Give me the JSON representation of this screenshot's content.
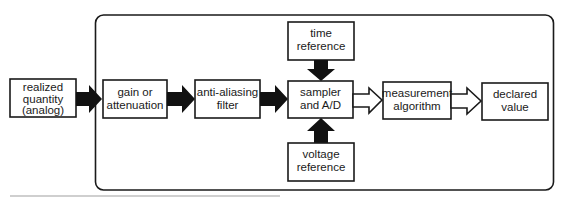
{
  "diagram": {
    "type": "block-diagram",
    "colors": {
      "stroke": "#1a1a1a",
      "background": "#ffffff",
      "rule": "#9a9a9a"
    },
    "input": {
      "lines": [
        "realized",
        "quantity",
        "(analog)"
      ]
    },
    "blocks": {
      "gain": {
        "lines": [
          "gain or",
          "attenuation"
        ]
      },
      "filter": {
        "lines": [
          "anti-aliasing",
          "filter"
        ]
      },
      "sampler": {
        "lines": [
          "sampler",
          "and A/D"
        ]
      },
      "time_ref": {
        "lines": [
          "time",
          "reference"
        ]
      },
      "voltage_ref": {
        "lines": [
          "voltage",
          "reference"
        ]
      },
      "algorithm": {
        "lines": [
          "measurement",
          "algorithm"
        ]
      },
      "output": {
        "lines": [
          "declared",
          "value"
        ]
      }
    },
    "arrows": [
      {
        "from": "input",
        "to": "gain",
        "style": "solid"
      },
      {
        "from": "gain",
        "to": "filter",
        "style": "solid"
      },
      {
        "from": "filter",
        "to": "sampler",
        "style": "solid"
      },
      {
        "from": "time_ref",
        "to": "sampler",
        "style": "solid"
      },
      {
        "from": "voltage_ref",
        "to": "sampler",
        "style": "solid"
      },
      {
        "from": "sampler",
        "to": "algorithm",
        "style": "hollow"
      },
      {
        "from": "algorithm",
        "to": "output",
        "style": "hollow"
      }
    ]
  }
}
